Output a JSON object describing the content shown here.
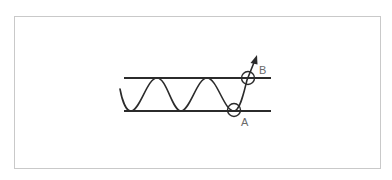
{
  "diagram": {
    "type": "price-channel-breakout",
    "lines": {
      "resistance": {
        "name": "upper-channel-line",
        "y": 78,
        "x_start": 124,
        "x_end": 271
      },
      "support": {
        "name": "lower-channel-line",
        "y": 111,
        "x_start": 124,
        "x_end": 271
      }
    },
    "points": [
      {
        "id": "A",
        "label": "A",
        "description": "touch of lower channel line",
        "cx": 234,
        "cy": 110
      },
      {
        "id": "B",
        "label": "B",
        "description": "breakout through upper channel line",
        "cx": 248,
        "cy": 78
      }
    ],
    "colors": {
      "line": "#2b2b2b",
      "label": "#6a6a6a",
      "frame": "#c9c9c9",
      "background": "#ffffff"
    }
  }
}
